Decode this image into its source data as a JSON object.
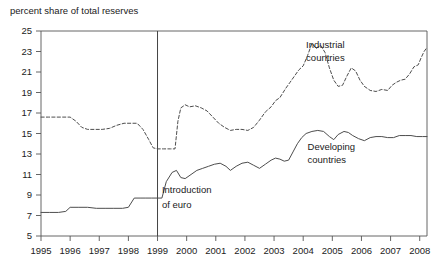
{
  "chart_data": {
    "type": "line",
    "title": "percent share of total reserves",
    "xlabel": "",
    "ylabel": "",
    "xlim": [
      1995,
      2008.25
    ],
    "ylim": [
      5,
      25
    ],
    "yticks": [
      5,
      7,
      9,
      11,
      13,
      15,
      17,
      19,
      21,
      23,
      25
    ],
    "xticks": [
      1995,
      1996,
      1997,
      1998,
      1999,
      2000,
      2001,
      2002,
      2003,
      2004,
      2005,
      2006,
      2007,
      2008
    ],
    "xtick_labels": [
      "1995",
      "1996",
      "1997",
      "1998",
      "1999",
      "2000",
      "2001",
      "2002",
      "2003",
      "2004",
      "2005",
      "2006",
      "2007",
      "2008"
    ],
    "ytick_labels": [
      "5",
      "7",
      "9",
      "11",
      "13",
      "15",
      "17",
      "19",
      "21",
      "23",
      "25"
    ],
    "grid": false,
    "legend_position": "inline-annotation",
    "series": [
      {
        "name": "Industrial countries",
        "style": "dashed",
        "color": "#4d4d4d",
        "label_x": 2004.1,
        "label_y": 23.3,
        "points": [
          [
            1995.0,
            16.6
          ],
          [
            1995.25,
            16.6
          ],
          [
            1995.5,
            16.6
          ],
          [
            1995.75,
            16.6
          ],
          [
            1996.0,
            16.6
          ],
          [
            1996.2,
            16.2
          ],
          [
            1996.4,
            15.6
          ],
          [
            1996.6,
            15.4
          ],
          [
            1996.85,
            15.4
          ],
          [
            1997.1,
            15.4
          ],
          [
            1997.35,
            15.5
          ],
          [
            1997.6,
            15.8
          ],
          [
            1997.85,
            16.0
          ],
          [
            1998.1,
            16.0
          ],
          [
            1998.3,
            16.0
          ],
          [
            1998.5,
            15.4
          ],
          [
            1998.7,
            14.4
          ],
          [
            1998.85,
            13.6
          ],
          [
            1999.0,
            13.5
          ],
          [
            1999.2,
            13.5
          ],
          [
            1999.45,
            13.5
          ],
          [
            1999.6,
            13.5
          ],
          [
            1999.7,
            16.2
          ],
          [
            1999.8,
            17.5
          ],
          [
            1999.95,
            17.8
          ],
          [
            2000.1,
            17.6
          ],
          [
            2000.3,
            17.7
          ],
          [
            2000.5,
            17.5
          ],
          [
            2000.7,
            17.2
          ],
          [
            2000.9,
            16.6
          ],
          [
            2001.1,
            16.0
          ],
          [
            2001.3,
            15.6
          ],
          [
            2001.5,
            15.3
          ],
          [
            2001.7,
            15.4
          ],
          [
            2001.9,
            15.4
          ],
          [
            2002.1,
            15.3
          ],
          [
            2002.3,
            15.6
          ],
          [
            2002.5,
            16.3
          ],
          [
            2002.7,
            17.1
          ],
          [
            2002.9,
            17.6
          ],
          [
            2003.05,
            18.2
          ],
          [
            2003.2,
            18.5
          ],
          [
            2003.4,
            19.4
          ],
          [
            2003.55,
            20.0
          ],
          [
            2003.7,
            20.6
          ],
          [
            2003.85,
            21.2
          ],
          [
            2004.0,
            21.6
          ],
          [
            2004.15,
            22.6
          ],
          [
            2004.3,
            23.8
          ],
          [
            2004.45,
            23.3
          ],
          [
            2004.6,
            23.6
          ],
          [
            2004.75,
            22.9
          ],
          [
            2004.9,
            21.4
          ],
          [
            2005.05,
            20.2
          ],
          [
            2005.2,
            19.6
          ],
          [
            2005.35,
            19.7
          ],
          [
            2005.5,
            20.6
          ],
          [
            2005.65,
            21.4
          ],
          [
            2005.8,
            21.1
          ],
          [
            2005.95,
            20.2
          ],
          [
            2006.1,
            19.6
          ],
          [
            2006.3,
            19.2
          ],
          [
            2006.5,
            19.1
          ],
          [
            2006.7,
            19.3
          ],
          [
            2006.9,
            19.2
          ],
          [
            2007.05,
            19.7
          ],
          [
            2007.2,
            20.0
          ],
          [
            2007.35,
            20.2
          ],
          [
            2007.5,
            20.3
          ],
          [
            2007.65,
            20.8
          ],
          [
            2007.8,
            21.5
          ],
          [
            2007.95,
            21.7
          ],
          [
            2008.05,
            22.4
          ],
          [
            2008.15,
            23.0
          ],
          [
            2008.25,
            23.4
          ]
        ]
      },
      {
        "name": "Developing countries",
        "style": "solid",
        "color": "#4d4d4d",
        "label_x": 2004.15,
        "label_y": 13.4,
        "points": [
          [
            1995.0,
            7.3
          ],
          [
            1995.3,
            7.3
          ],
          [
            1995.6,
            7.3
          ],
          [
            1995.85,
            7.4
          ],
          [
            1996.0,
            7.8
          ],
          [
            1996.3,
            7.8
          ],
          [
            1996.6,
            7.8
          ],
          [
            1996.9,
            7.7
          ],
          [
            1997.2,
            7.7
          ],
          [
            1997.5,
            7.7
          ],
          [
            1997.8,
            7.7
          ],
          [
            1998.0,
            7.8
          ],
          [
            1998.2,
            8.7
          ],
          [
            1998.4,
            8.7
          ],
          [
            1998.6,
            8.7
          ],
          [
            1998.8,
            8.7
          ],
          [
            1999.0,
            8.7
          ],
          [
            1999.15,
            8.7
          ],
          [
            1999.3,
            10.3
          ],
          [
            1999.5,
            11.2
          ],
          [
            1999.65,
            11.4
          ],
          [
            1999.8,
            10.7
          ],
          [
            1999.95,
            10.6
          ],
          [
            2000.15,
            11.0
          ],
          [
            2000.35,
            11.4
          ],
          [
            2000.55,
            11.6
          ],
          [
            2000.75,
            11.8
          ],
          [
            2000.95,
            12.0
          ],
          [
            2001.15,
            12.1
          ],
          [
            2001.35,
            11.8
          ],
          [
            2001.5,
            11.4
          ],
          [
            2001.7,
            11.8
          ],
          [
            2001.9,
            12.1
          ],
          [
            2002.1,
            12.2
          ],
          [
            2002.3,
            11.9
          ],
          [
            2002.5,
            11.6
          ],
          [
            2002.7,
            12.0
          ],
          [
            2002.9,
            12.4
          ],
          [
            2003.05,
            12.6
          ],
          [
            2003.2,
            12.5
          ],
          [
            2003.35,
            12.3
          ],
          [
            2003.5,
            12.4
          ],
          [
            2003.65,
            13.2
          ],
          [
            2003.8,
            14.0
          ],
          [
            2003.95,
            14.6
          ],
          [
            2004.1,
            15.0
          ],
          [
            2004.3,
            15.2
          ],
          [
            2004.5,
            15.3
          ],
          [
            2004.7,
            15.2
          ],
          [
            2004.9,
            14.7
          ],
          [
            2005.05,
            14.4
          ],
          [
            2005.2,
            14.9
          ],
          [
            2005.4,
            15.2
          ],
          [
            2005.55,
            15.1
          ],
          [
            2005.7,
            14.8
          ],
          [
            2005.9,
            14.5
          ],
          [
            2006.1,
            14.3
          ],
          [
            2006.3,
            14.6
          ],
          [
            2006.5,
            14.7
          ],
          [
            2006.7,
            14.7
          ],
          [
            2006.9,
            14.6
          ],
          [
            2007.1,
            14.6
          ],
          [
            2007.3,
            14.8
          ],
          [
            2007.5,
            14.8
          ],
          [
            2007.7,
            14.8
          ],
          [
            2007.9,
            14.7
          ],
          [
            2008.1,
            14.7
          ],
          [
            2008.25,
            14.7
          ]
        ]
      }
    ],
    "annotations": [
      {
        "name": "introduction-of-euro",
        "line_x": 1999.0,
        "text_line1": "Introduction",
        "text_line2": "of euro",
        "text_x": 1999.15,
        "text_y1": 9.2,
        "text_y2": 7.7
      }
    ]
  }
}
